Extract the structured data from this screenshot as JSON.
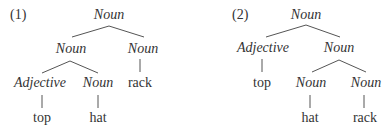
{
  "trees": [
    {
      "id": "tree-1",
      "number": "(1)",
      "nodes": {
        "root": "Noun",
        "left": "Noun",
        "right": "Noun",
        "left_left": "Adjective",
        "left_right": "Noun",
        "word_top": "top",
        "word_hat": "hat",
        "word_rack": "rack"
      }
    },
    {
      "id": "tree-2",
      "number": "(2)",
      "nodes": {
        "root": "Noun",
        "left": "Adjective",
        "right": "Noun",
        "right_left": "Noun",
        "right_right": "Noun",
        "word_top": "top",
        "word_hat": "hat",
        "word_rack": "rack"
      }
    }
  ],
  "colors": {
    "text": "#333333",
    "edge": "#555555",
    "background": "#ffffff"
  }
}
